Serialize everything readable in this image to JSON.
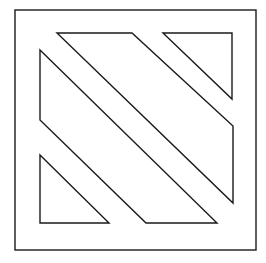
{
  "diagram": {
    "title": "",
    "stroke_color": "#1a1a1a",
    "background_color": "#ffffff",
    "shapes": [
      {
        "name": "outer-square"
      },
      {
        "name": "top-right-triangle"
      },
      {
        "name": "upper-diagonal-band"
      },
      {
        "name": "lower-diagonal-band"
      },
      {
        "name": "bottom-left-triangle"
      }
    ]
  }
}
